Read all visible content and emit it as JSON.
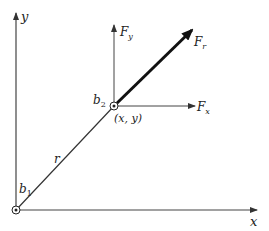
{
  "diagram": {
    "axes": {
      "x_label": "x",
      "y_label": "y"
    },
    "points": {
      "origin_label": "b",
      "origin_sub": "1",
      "end_label": "b",
      "end_sub": "2",
      "coord_label": "(x, y)"
    },
    "segment_label": "r",
    "forces": {
      "radial": "F",
      "radial_sub": "r",
      "vertical": "F",
      "vertical_sub": "y",
      "horizontal": "F",
      "horizontal_sub": "x"
    },
    "colors": {
      "line": "#333333",
      "force": "#111111"
    }
  }
}
